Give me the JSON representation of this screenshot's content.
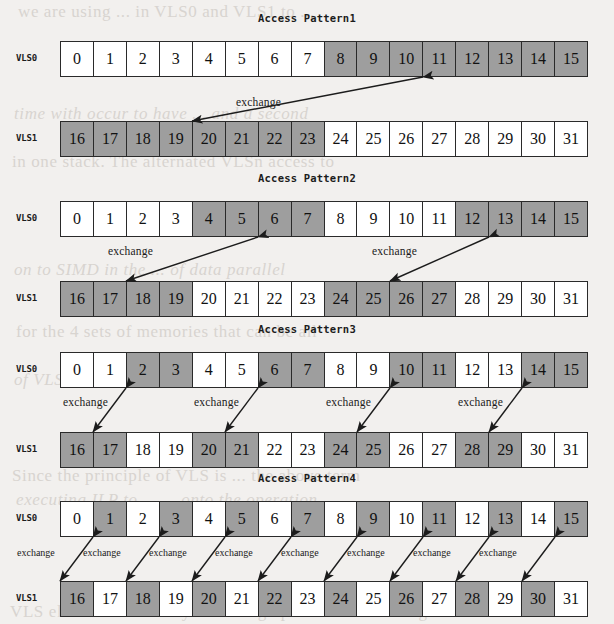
{
  "figure": {
    "kind": "access-pattern-diagram",
    "background_color": "#f2f0ee",
    "cell_fill_light": "#ffffff",
    "cell_fill_shaded": "#9e9e9e",
    "line_color": "#2a2a2a",
    "row_label_top": "VLS0",
    "row_label_bottom": "VLS1",
    "exchange_label": "exchange"
  },
  "patterns": [
    {
      "title": "Access Pattern1",
      "rows": [
        {
          "label": "VLS0",
          "cells": [
            {
              "value": "0",
              "shaded": false
            },
            {
              "value": "1",
              "shaded": false
            },
            {
              "value": "2",
              "shaded": false
            },
            {
              "value": "3",
              "shaded": false
            },
            {
              "value": "4",
              "shaded": false
            },
            {
              "value": "5",
              "shaded": false
            },
            {
              "value": "6",
              "shaded": false
            },
            {
              "value": "7",
              "shaded": false
            },
            {
              "value": "8",
              "shaded": true
            },
            {
              "value": "9",
              "shaded": true
            },
            {
              "value": "10",
              "shaded": true
            },
            {
              "value": "11",
              "shaded": true
            },
            {
              "value": "12",
              "shaded": true
            },
            {
              "value": "13",
              "shaded": true
            },
            {
              "value": "14",
              "shaded": true
            },
            {
              "value": "15",
              "shaded": true
            }
          ]
        },
        {
          "label": "VLS1",
          "cells": [
            {
              "value": "16",
              "shaded": true
            },
            {
              "value": "17",
              "shaded": true
            },
            {
              "value": "18",
              "shaded": true
            },
            {
              "value": "19",
              "shaded": true
            },
            {
              "value": "20",
              "shaded": true
            },
            {
              "value": "21",
              "shaded": true
            },
            {
              "value": "22",
              "shaded": true
            },
            {
              "value": "23",
              "shaded": true
            },
            {
              "value": "24",
              "shaded": false
            },
            {
              "value": "25",
              "shaded": false
            },
            {
              "value": "26",
              "shaded": false
            },
            {
              "value": "27",
              "shaded": false
            },
            {
              "value": "28",
              "shaded": false
            },
            {
              "value": "29",
              "shaded": false
            },
            {
              "value": "30",
              "shaded": false
            },
            {
              "value": "31",
              "shaded": false
            }
          ]
        }
      ],
      "exchanges": [
        {
          "label": "exchange",
          "top_index": 11,
          "bottom_index": 4,
          "label_x": 236,
          "label_y": 96
        }
      ]
    },
    {
      "title": "Access Pattern2",
      "rows": [
        {
          "label": "VLS0",
          "cells": [
            {
              "value": "0",
              "shaded": false
            },
            {
              "value": "1",
              "shaded": false
            },
            {
              "value": "2",
              "shaded": false
            },
            {
              "value": "3",
              "shaded": false
            },
            {
              "value": "4",
              "shaded": true
            },
            {
              "value": "5",
              "shaded": true
            },
            {
              "value": "6",
              "shaded": true
            },
            {
              "value": "7",
              "shaded": true
            },
            {
              "value": "8",
              "shaded": false
            },
            {
              "value": "9",
              "shaded": false
            },
            {
              "value": "10",
              "shaded": false
            },
            {
              "value": "11",
              "shaded": false
            },
            {
              "value": "12",
              "shaded": true
            },
            {
              "value": "13",
              "shaded": true
            },
            {
              "value": "14",
              "shaded": true
            },
            {
              "value": "15",
              "shaded": true
            }
          ]
        },
        {
          "label": "VLS1",
          "cells": [
            {
              "value": "16",
              "shaded": true
            },
            {
              "value": "17",
              "shaded": true
            },
            {
              "value": "18",
              "shaded": true
            },
            {
              "value": "19",
              "shaded": true
            },
            {
              "value": "20",
              "shaded": false
            },
            {
              "value": "21",
              "shaded": false
            },
            {
              "value": "22",
              "shaded": false
            },
            {
              "value": "23",
              "shaded": false
            },
            {
              "value": "24",
              "shaded": true
            },
            {
              "value": "25",
              "shaded": true
            },
            {
              "value": "26",
              "shaded": true
            },
            {
              "value": "27",
              "shaded": true
            },
            {
              "value": "28",
              "shaded": false
            },
            {
              "value": "29",
              "shaded": false
            },
            {
              "value": "30",
              "shaded": false
            },
            {
              "value": "31",
              "shaded": false
            }
          ]
        }
      ],
      "exchanges": [
        {
          "label": "exchange",
          "top_index": 6,
          "bottom_index": 2,
          "label_x": 108,
          "label_y": 245
        },
        {
          "label": "exchange",
          "top_index": 13,
          "bottom_index": 10,
          "label_x": 372,
          "label_y": 245
        }
      ]
    },
    {
      "title": "Access Pattern3",
      "rows": [
        {
          "label": "VLS0",
          "cells": [
            {
              "value": "0",
              "shaded": false
            },
            {
              "value": "1",
              "shaded": false
            },
            {
              "value": "2",
              "shaded": true
            },
            {
              "value": "3",
              "shaded": true
            },
            {
              "value": "4",
              "shaded": false
            },
            {
              "value": "5",
              "shaded": false
            },
            {
              "value": "6",
              "shaded": true
            },
            {
              "value": "7",
              "shaded": true
            },
            {
              "value": "8",
              "shaded": false
            },
            {
              "value": "9",
              "shaded": false
            },
            {
              "value": "10",
              "shaded": true
            },
            {
              "value": "11",
              "shaded": true
            },
            {
              "value": "12",
              "shaded": false
            },
            {
              "value": "13",
              "shaded": false
            },
            {
              "value": "14",
              "shaded": true
            },
            {
              "value": "15",
              "shaded": true
            }
          ]
        },
        {
          "label": "VLS1",
          "cells": [
            {
              "value": "16",
              "shaded": true
            },
            {
              "value": "17",
              "shaded": true
            },
            {
              "value": "18",
              "shaded": false
            },
            {
              "value": "19",
              "shaded": false
            },
            {
              "value": "20",
              "shaded": true
            },
            {
              "value": "21",
              "shaded": true
            },
            {
              "value": "22",
              "shaded": false
            },
            {
              "value": "23",
              "shaded": false
            },
            {
              "value": "24",
              "shaded": true
            },
            {
              "value": "25",
              "shaded": true
            },
            {
              "value": "26",
              "shaded": false
            },
            {
              "value": "27",
              "shaded": false
            },
            {
              "value": "28",
              "shaded": true
            },
            {
              "value": "29",
              "shaded": true
            },
            {
              "value": "30",
              "shaded": false
            },
            {
              "value": "31",
              "shaded": false
            }
          ]
        }
      ],
      "exchanges": [
        {
          "label": "exchange",
          "top_index": 2,
          "bottom_index": 1,
          "label_x": 63,
          "label_y": 396
        },
        {
          "label": "exchange",
          "top_index": 6,
          "bottom_index": 5,
          "label_x": 194,
          "label_y": 396
        },
        {
          "label": "exchange",
          "top_index": 10,
          "bottom_index": 9,
          "label_x": 326,
          "label_y": 396
        },
        {
          "label": "exchange",
          "top_index": 14,
          "bottom_index": 13,
          "label_x": 458,
          "label_y": 396
        }
      ]
    },
    {
      "title": "Access Pattern4",
      "rows": [
        {
          "label": "VLS0",
          "cells": [
            {
              "value": "0",
              "shaded": false
            },
            {
              "value": "1",
              "shaded": true
            },
            {
              "value": "2",
              "shaded": false
            },
            {
              "value": "3",
              "shaded": true
            },
            {
              "value": "4",
              "shaded": false
            },
            {
              "value": "5",
              "shaded": true
            },
            {
              "value": "6",
              "shaded": false
            },
            {
              "value": "7",
              "shaded": true
            },
            {
              "value": "8",
              "shaded": false
            },
            {
              "value": "9",
              "shaded": true
            },
            {
              "value": "10",
              "shaded": false
            },
            {
              "value": "11",
              "shaded": true
            },
            {
              "value": "12",
              "shaded": false
            },
            {
              "value": "13",
              "shaded": true
            },
            {
              "value": "14",
              "shaded": false
            },
            {
              "value": "15",
              "shaded": true
            }
          ]
        },
        {
          "label": "VLS1",
          "cells": [
            {
              "value": "16",
              "shaded": true
            },
            {
              "value": "17",
              "shaded": false
            },
            {
              "value": "18",
              "shaded": true
            },
            {
              "value": "19",
              "shaded": false
            },
            {
              "value": "20",
              "shaded": true
            },
            {
              "value": "21",
              "shaded": false
            },
            {
              "value": "22",
              "shaded": true
            },
            {
              "value": "23",
              "shaded": false
            },
            {
              "value": "24",
              "shaded": true
            },
            {
              "value": "25",
              "shaded": false
            },
            {
              "value": "26",
              "shaded": true
            },
            {
              "value": "27",
              "shaded": false
            },
            {
              "value": "28",
              "shaded": true
            },
            {
              "value": "29",
              "shaded": false
            },
            {
              "value": "30",
              "shaded": true
            },
            {
              "value": "31",
              "shaded": false
            }
          ]
        }
      ],
      "exchanges": [
        {
          "label": "exchange",
          "top_index": 1,
          "bottom_index": 0,
          "label_x": 17,
          "label_y": 547
        },
        {
          "label": "exchange",
          "top_index": 3,
          "bottom_index": 2,
          "label_x": 83,
          "label_y": 547
        },
        {
          "label": "exchange",
          "top_index": 5,
          "bottom_index": 4,
          "label_x": 149,
          "label_y": 547
        },
        {
          "label": "exchange",
          "top_index": 7,
          "bottom_index": 6,
          "label_x": 215,
          "label_y": 547
        },
        {
          "label": "exchange",
          "top_index": 9,
          "bottom_index": 8,
          "label_x": 281,
          "label_y": 547
        },
        {
          "label": "exchange",
          "top_index": 11,
          "bottom_index": 10,
          "label_x": 347,
          "label_y": 547
        },
        {
          "label": "exchange",
          "top_index": 13,
          "bottom_index": 12,
          "label_x": 413,
          "label_y": 547
        },
        {
          "label": "exchange",
          "top_index": 15,
          "bottom_index": 14,
          "label_x": 479,
          "label_y": 547
        }
      ]
    }
  ],
  "geometry": {
    "grid_left": 60,
    "grid_width": 528,
    "row_height": 36,
    "pattern_tops": [
      0,
      160,
      311,
      460
    ],
    "title_offset": 12,
    "top_row_offset": 41,
    "bottom_row_offset": 121
  },
  "bleed_text": [
    {
      "text": "we  are  using  ... in  VLS0  and  VLS1  to  ...",
      "x": 18,
      "y": 2,
      "italic": false
    },
    {
      "text": "time  with  occur  to  have ... and  a  second",
      "x": 14,
      "y": 104,
      "italic": true
    },
    {
      "text": "in  one  stack.    The  alternated  VLSn  access  to",
      "x": 12,
      "y": 152,
      "italic": false
    },
    {
      "text": "on  to  SIMD  in  the  ...  of  data  parallel",
      "x": 14,
      "y": 260,
      "italic": true
    },
    {
      "text": "for  the  4  sets  of  memories  that  can  be  all",
      "x": 16,
      "y": 322,
      "italic": false
    },
    {
      "text": "of  VLS0  and  VLS1  ...  with  the  same  bits",
      "x": 14,
      "y": 370,
      "italic": true
    },
    {
      "text": "Since  the  principle  of  VLS  is  ...  the  above  term",
      "x": 12,
      "y": 466,
      "italic": false
    },
    {
      "text": "executing  ILP  to  ...  ...  onto  the  operation",
      "x": 16,
      "y": 490,
      "italic": true
    },
    {
      "text": "VLS  elements  are  the  cycle  setting  operation  concerning",
      "x": 10,
      "y": 602,
      "italic": false
    }
  ]
}
